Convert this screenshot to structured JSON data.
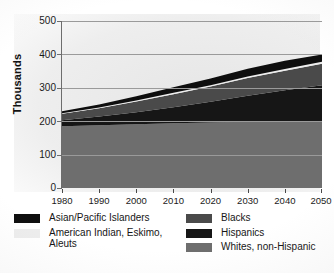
{
  "chart_data": {
    "type": "area",
    "title": "",
    "xlabel": "",
    "ylabel": "Thousands",
    "x": [
      1980,
      1990,
      2000,
      2010,
      2020,
      2030,
      2040,
      2050
    ],
    "xlim": [
      1980,
      2050
    ],
    "ylim": [
      0,
      500
    ],
    "yticks": [
      0,
      100,
      200,
      300,
      400,
      500
    ],
    "xticks": [
      1980,
      1990,
      2000,
      2010,
      2020,
      2030,
      2040,
      2050
    ],
    "grid": true,
    "stacked": true,
    "legend_position": "bottom",
    "stack_order_bottom_to_top": [
      "Whites, non-Hispanic",
      "Hispanics",
      "Blacks",
      "American Indian, Eskimo, Aleuts",
      "Asian/Pacific Islanders"
    ],
    "series": [
      {
        "name": "Whites, non-Hispanic",
        "color": "#6e6e6e",
        "values": [
          185,
          188,
          191,
          194,
          196,
          198,
          199,
          198
        ]
      },
      {
        "name": "Hispanics",
        "color": "#161616",
        "values": [
          18,
          26,
          36,
          48,
          62,
          78,
          94,
          110
        ]
      },
      {
        "name": "Blacks",
        "color": "#4a4a4a",
        "values": [
          19,
          25,
          32,
          39,
          46,
          53,
          58,
          64
        ]
      },
      {
        "name": "American Indian, Eskimo, Aleuts",
        "color": "#ededed",
        "values": [
          2,
          2,
          3,
          4,
          4,
          5,
          5,
          6
        ]
      },
      {
        "name": "Asian/Pacific Islanders",
        "color": "#0e0e0e",
        "values": [
          6,
          9,
          13,
          17,
          20,
          23,
          25,
          22
        ]
      }
    ],
    "totals": [
      230,
      250,
      275,
      302,
      328,
      357,
      381,
      400
    ],
    "axis_ticks_y_labels": [
      "0",
      "100",
      "200",
      "300",
      "400",
      "500"
    ],
    "axis_ticks_x_labels": [
      "1980",
      "1990",
      "2000",
      "2010",
      "2020",
      "2030",
      "2040",
      "2050"
    ]
  },
  "axis": {
    "y_title": "Thousands",
    "y_ticks": [
      "500",
      "400",
      "300",
      "200",
      "100",
      "0"
    ],
    "x_ticks": [
      "1980",
      "1990",
      "2000",
      "2010",
      "2020",
      "2030",
      "2040",
      "2050"
    ]
  },
  "legend": {
    "left_items": [
      {
        "label": "Asian/Pacific Islanders",
        "color": "#0e0e0e"
      },
      {
        "label": "American Indian, Eskimo,\nAleuts",
        "color": "#ededed"
      }
    ],
    "right_items": [
      {
        "label": "Blacks",
        "color": "#4a4a4a"
      },
      {
        "label": "Hispanics",
        "color": "#161616"
      },
      {
        "label": "Whites, non-Hispanic",
        "color": "#6e6e6e"
      }
    ]
  }
}
